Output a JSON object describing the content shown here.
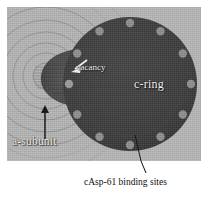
{
  "figure": {
    "type": "scientific-micrograph-diagram",
    "panel": {
      "background_color": "#b6b6b6",
      "border_color": "#ffffff"
    },
    "structures": {
      "c_ring": {
        "label": "c-ring",
        "fill_color": "#3a3a3a",
        "center_x": 130,
        "center_y": 84,
        "radius": 67,
        "subunit_count": 12,
        "subunit_color": "#8e8e8e",
        "subunit_radius": 4.2,
        "vacancy_index": 7
      },
      "a_subunit": {
        "label": "a-subunit",
        "contour_color": "#8a8a8a",
        "bulge_color": "#4a4a4a",
        "center_x": 46,
        "center_y": 76,
        "contour_radii": [
          14,
          24,
          34,
          45,
          57,
          70
        ]
      }
    },
    "labels": {
      "vacancy": "vacancy",
      "c_ring": "c-ring",
      "a_subunit": "a-subunit",
      "binding_sites": "cAsp-61 binding sites"
    },
    "annotations": {
      "vacancy_arrow": "white-arrow-pointing-left-down",
      "a_subunit_arrow": "black-arrow-pointing-up",
      "binding_sites_leader": "black-leader-line"
    },
    "colors": {
      "panel_bg": "#b6b6b6",
      "ring_dark": "#3a3a3a",
      "subunit_dot": "#8e8e8e",
      "label_white": "#f2f2f2",
      "label_black": "#111111"
    }
  }
}
